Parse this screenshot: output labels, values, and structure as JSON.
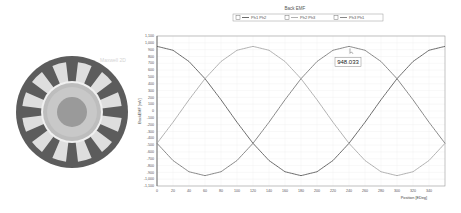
{
  "motor": {
    "watermark": "Maxwell 2D",
    "slot_count": 12,
    "colors": {
      "stator": "#5c5c5c",
      "slot": "#dedede",
      "airgap_ring": "#bdbdbd",
      "rotor": "#c8c8c8",
      "shaft": "#9a9a9a"
    }
  },
  "chart_data": {
    "type": "line",
    "title": "Back EMF",
    "xlabel": "Position [EDeg]",
    "ylabel": "BackEMF [mV]",
    "xlim": [
      0,
      360
    ],
    "ylim": [
      -1100,
      1100
    ],
    "xticks": [
      0,
      20,
      40,
      60,
      80,
      100,
      120,
      140,
      160,
      180,
      200,
      220,
      240,
      260,
      280,
      300,
      320,
      340
    ],
    "yticks": [
      -1100,
      -1000,
      -900,
      -800,
      -700,
      -600,
      -500,
      -400,
      -300,
      -200,
      -100,
      0,
      100,
      200,
      300,
      400,
      500,
      600,
      700,
      800,
      900,
      1000,
      1100
    ],
    "ytick_labels": [
      "-1,100",
      "-1,000",
      "-900",
      "-800",
      "-700",
      "-600",
      "-500",
      "-400",
      "-300",
      "-200",
      "-100",
      "0",
      "100",
      "200",
      "300",
      "400",
      "500",
      "600",
      "700",
      "800",
      "900",
      "1,000",
      "1,100"
    ],
    "grid": true,
    "legend_position": "top-center",
    "x": [
      0,
      20,
      40,
      60,
      80,
      100,
      120,
      140,
      160,
      180,
      200,
      220,
      240,
      260,
      280,
      300,
      320,
      340,
      360
    ],
    "series": [
      {
        "name": "Ph1 Ph2",
        "color": "#5a5a5a",
        "values": [
          948,
          891,
          726,
          474,
          165,
          -165,
          -474,
          -726,
          -891,
          -948,
          -891,
          -726,
          -474,
          -165,
          165,
          474,
          726,
          891,
          948
        ]
      },
      {
        "name": "Ph2 Ph3",
        "color": "#a8a8a8",
        "values": [
          -474,
          -165,
          165,
          474,
          726,
          891,
          948,
          891,
          726,
          474,
          165,
          -165,
          -474,
          -726,
          -891,
          -948,
          -891,
          -726,
          -474
        ]
      },
      {
        "name": "Ph3 Ph1",
        "color": "#7a7a7a",
        "values": [
          -474,
          -726,
          -891,
          -948,
          -891,
          -726,
          -474,
          -165,
          165,
          474,
          726,
          891,
          948,
          891,
          726,
          474,
          165,
          -165,
          -474
        ]
      }
    ],
    "annotation": {
      "text": "948.033",
      "x": 240,
      "y": 948.033,
      "series": "Ph3 Ph1"
    }
  }
}
